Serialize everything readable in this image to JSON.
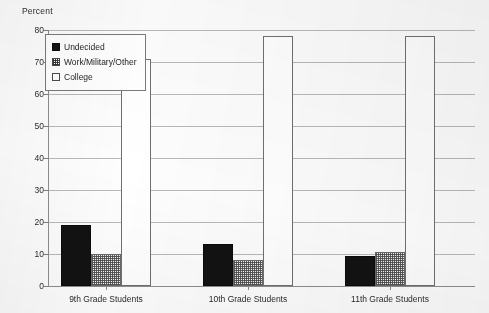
{
  "chart_data": {
    "type": "bar",
    "title": "",
    "xlabel": "",
    "ylabel": "Percent",
    "ylim": [
      0,
      80
    ],
    "ytick_step": 10,
    "yticks": [
      0,
      10,
      20,
      30,
      40,
      50,
      60,
      70,
      80
    ],
    "grid": true,
    "legend_position": "top-left-inside",
    "categories": [
      "9th Grade Students",
      "10th Grade Students",
      "11th Grade Students"
    ],
    "series": [
      {
        "name": "Undecided",
        "values": [
          19,
          13,
          9.5
        ],
        "color": "#121212",
        "fill": "solid-black"
      },
      {
        "name": "Work/Military/Other",
        "values": [
          10,
          8,
          10.5
        ],
        "color": "#f2f2f2",
        "fill": "checkered"
      },
      {
        "name": "College",
        "values": [
          71,
          78,
          78
        ],
        "color": "#ffffff",
        "fill": "white"
      }
    ]
  },
  "axis": {
    "y_title": "Percent",
    "y_tick_labels": [
      "80",
      "70",
      "60",
      "50",
      "40",
      "30",
      "20",
      "10",
      "0"
    ],
    "x_tick_labels": [
      "9th Grade Students",
      "10th Grade Students",
      "11th Grade Students"
    ]
  },
  "legend": {
    "items": [
      {
        "label": "Undecided",
        "swatch": "solid-black-square-icon"
      },
      {
        "label": "Work/Military/Other",
        "swatch": "checkered-square-icon"
      },
      {
        "label": "College",
        "swatch": "white-square-icon"
      }
    ]
  },
  "colors": {
    "undecided": "#121212",
    "work_military_other": "#f2f2f2",
    "college": "#ffffff",
    "gridline": "#b9b9b9",
    "axis": "#8d8d8d",
    "text": "#2b2b2b"
  }
}
